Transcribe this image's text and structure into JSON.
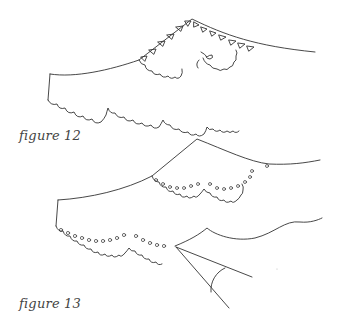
{
  "figures": [
    {
      "id": "figure-12",
      "caption": "figure 12",
      "description": "Sleeve/collar outline with scalloped hem and triangle-edged inner scallop panel"
    },
    {
      "id": "figure-13",
      "caption": "figure 13",
      "description": "Outline with looped/eyelet scallop edging and an angle marking at the hem point"
    }
  ],
  "colors": {
    "line": "#333333",
    "background": "#ffffff",
    "caption": "#444444"
  }
}
